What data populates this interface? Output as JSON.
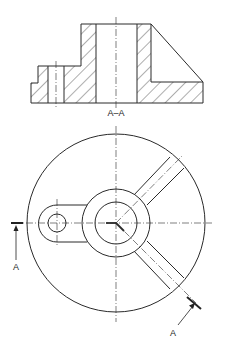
{
  "drawing": {
    "type": "engineering section drawing",
    "section_view_label": "A–A",
    "cut_plane_labels": [
      "A",
      "A"
    ],
    "line_color": "#2a2a2a",
    "background": "#ffffff"
  }
}
